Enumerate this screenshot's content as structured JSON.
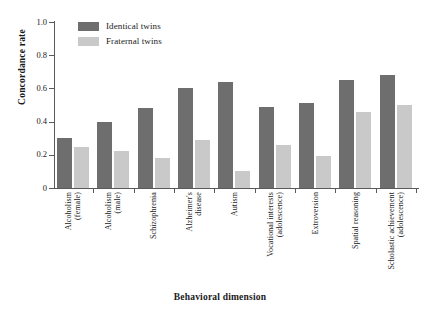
{
  "chart_data": {
    "type": "bar",
    "title": "",
    "xlabel": "Behavioral dimension",
    "ylabel": "Concordance rate",
    "ylim": [
      0,
      1.0
    ],
    "ytick_labels": [
      "1.0",
      "0.8",
      "0.6",
      "0.4",
      "0.2",
      "0"
    ],
    "ytick_values": [
      1.0,
      0.8,
      0.6,
      0.4,
      0.2,
      0
    ],
    "grid": false,
    "legend_position": "top-left-inside",
    "categories": [
      "Alcoholism (female)",
      "Alcoholism (male)",
      "Schizophrenia",
      "Alzheimer's disease",
      "Autism",
      "Vocational interests (adolescence)",
      "Extroversion",
      "Spatial reasoning",
      "Scholastic achievement (adolescence)"
    ],
    "category_lines": [
      [
        "Alcoholism",
        "(female)"
      ],
      [
        "Alcoholism",
        "(male)"
      ],
      [
        "Schizophrenia",
        ""
      ],
      [
        "Alzheimer's",
        "disease"
      ],
      [
        "Autism",
        ""
      ],
      [
        "Vocational interests",
        "(adolescence)"
      ],
      [
        "Extroversion",
        ""
      ],
      [
        "Spatial reasoning",
        ""
      ],
      [
        "Scholastic achievement",
        "(adolescence)"
      ]
    ],
    "series": [
      {
        "name": "Identical twins",
        "color": "#6e6e6e",
        "values": [
          0.3,
          0.4,
          0.48,
          0.6,
          0.64,
          0.49,
          0.51,
          0.65,
          0.68
        ]
      },
      {
        "name": "Fraternal twins",
        "color": "#c9c9c9",
        "values": [
          0.25,
          0.22,
          0.18,
          0.29,
          0.1,
          0.26,
          0.19,
          0.46,
          0.5
        ]
      }
    ]
  },
  "legend": {
    "items": [
      {
        "label": "Identical twins",
        "color": "#6e6e6e"
      },
      {
        "label": "Fraternal twins",
        "color": "#c9c9c9"
      }
    ]
  },
  "axes": {
    "y_title": "Concordance rate",
    "x_title": "Behavioral dimension"
  }
}
